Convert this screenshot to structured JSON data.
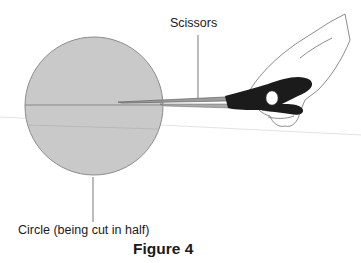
{
  "diagram": {
    "labels": {
      "scissors": "Scissors",
      "circle": "Circle (being cut in half)"
    },
    "caption": "Figure 4",
    "colors": {
      "circle_fill": "#c8c8c8",
      "circle_stroke": "#8a8a8a",
      "handle": "#1a1a1a",
      "blade": "#9a9a9a",
      "leader_line": "#555555"
    }
  }
}
